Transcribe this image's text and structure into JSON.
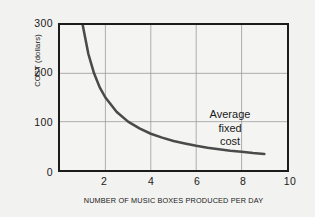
{
  "chart_data": {
    "type": "line",
    "title": "",
    "xlabel": "NUMBER OF MUSIC BOXES PRODUCED PER DAY",
    "ylabel": "COST (dollars)",
    "xlim": [
      0,
      10
    ],
    "ylim": [
      0,
      300
    ],
    "xticks": [
      "2",
      "4",
      "6",
      "8",
      "10"
    ],
    "xtick_values": [
      2,
      4,
      6,
      8,
      10
    ],
    "yticks": [
      "0",
      "100",
      "200",
      "300"
    ],
    "ytick_values": [
      0,
      100,
      200,
      300
    ],
    "grid": true,
    "legend": "none",
    "annotations": [
      {
        "name": "average-fixed-cost-label",
        "lines": [
          "Average",
          "fixed",
          "cost"
        ],
        "x": 7.0,
        "y": 95
      }
    ],
    "series": [
      {
        "name": "Average fixed cost",
        "formula": "AFC = 300 / Q",
        "color": "#4a4a4a",
        "x": [
          1.0,
          1.25,
          1.5,
          1.75,
          2.0,
          2.5,
          3.0,
          3.5,
          4.0,
          4.5,
          5.0,
          5.5,
          6.0,
          6.5,
          7.0,
          7.5,
          8.0,
          8.5,
          9.0
        ],
        "y": [
          300,
          240,
          200,
          171,
          150,
          120,
          100,
          86,
          75,
          67,
          60,
          55,
          50,
          46,
          43,
          40,
          38,
          35,
          33
        ]
      }
    ]
  },
  "colors": {
    "page_background": "#f2f2f0",
    "plot_background": "#f4f4f2",
    "frame": "#1c1c1c",
    "gridline": "#9a9a9a",
    "curve": "#4a4a4a",
    "text": "#1a1a1a"
  }
}
